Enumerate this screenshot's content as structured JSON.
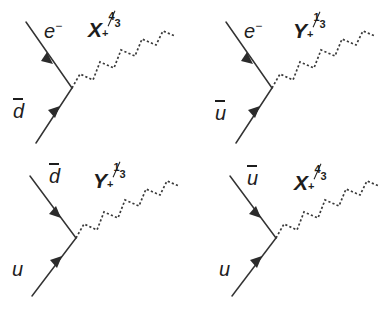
{
  "figure": {
    "background_color": "#ffffff",
    "line_color": "#333333",
    "text_color": "#1d1d1d",
    "width": 385,
    "height": 312,
    "layout": "2x2-grid"
  },
  "diagrams": [
    {
      "id": "top-left",
      "position": "top-left",
      "upper_leg": {
        "label_symbol": "e",
        "label_charge": "−",
        "has_antibar": false,
        "arrow_direction": "up-left",
        "arrow_toward_vertex": false
      },
      "lower_leg": {
        "label_symbol": "d",
        "label_charge": "",
        "has_antibar": true,
        "arrow_direction": "up-right",
        "arrow_toward_vertex": true
      },
      "boson": {
        "symbol": "X",
        "charge_sign": "+",
        "charge_numerator": "4",
        "charge_denominator": "3",
        "line_style": "dotted-zigzag"
      }
    },
    {
      "id": "top-right",
      "position": "top-right",
      "upper_leg": {
        "label_symbol": "e",
        "label_charge": "−",
        "has_antibar": false,
        "arrow_direction": "up-left",
        "arrow_toward_vertex": false
      },
      "lower_leg": {
        "label_symbol": "u",
        "label_charge": "",
        "has_antibar": true,
        "arrow_direction": "up-right",
        "arrow_toward_vertex": true
      },
      "boson": {
        "symbol": "Y",
        "charge_sign": "+",
        "charge_numerator": "1",
        "charge_denominator": "3",
        "line_style": "dotted-zigzag"
      }
    },
    {
      "id": "bottom-left",
      "position": "bottom-left",
      "upper_leg": {
        "label_symbol": "d",
        "label_charge": "",
        "has_antibar": true,
        "arrow_direction": "down-right",
        "arrow_toward_vertex": true
      },
      "lower_leg": {
        "label_symbol": "u",
        "label_charge": "",
        "has_antibar": false,
        "arrow_direction": "up-right",
        "arrow_toward_vertex": true
      },
      "boson": {
        "symbol": "Y",
        "charge_sign": "+",
        "charge_numerator": "1",
        "charge_denominator": "3",
        "line_style": "dotted-zigzag"
      }
    },
    {
      "id": "bottom-right",
      "position": "bottom-right",
      "upper_leg": {
        "label_symbol": "u",
        "label_charge": "",
        "has_antibar": true,
        "arrow_direction": "down-right",
        "arrow_toward_vertex": true
      },
      "lower_leg": {
        "label_symbol": "u",
        "label_charge": "",
        "has_antibar": false,
        "arrow_direction": "up-right",
        "arrow_toward_vertex": true
      },
      "boson": {
        "symbol": "X",
        "charge_sign": "+",
        "charge_numerator": "4",
        "charge_denominator": "3",
        "line_style": "dotted-zigzag"
      }
    }
  ],
  "labels": {
    "d0_upper": "e",
    "d0_upper_charge": "−",
    "d0_lower": "d",
    "d0_boson": "X",
    "d0_boson_sign": "+",
    "d0_boson_num": "4",
    "d0_boson_den": "3",
    "d1_upper": "e",
    "d1_upper_charge": "−",
    "d1_lower": "u",
    "d1_boson": "Y",
    "d1_boson_sign": "+",
    "d1_boson_num": "1",
    "d1_boson_den": "3",
    "d2_upper": "d",
    "d2_lower": "u",
    "d2_boson": "Y",
    "d2_boson_sign": "+",
    "d2_boson_num": "1",
    "d2_boson_den": "3",
    "d3_upper": "u",
    "d3_lower": "u",
    "d3_boson": "X",
    "d3_boson_sign": "+",
    "d3_boson_num": "4",
    "d3_boson_den": "3"
  }
}
